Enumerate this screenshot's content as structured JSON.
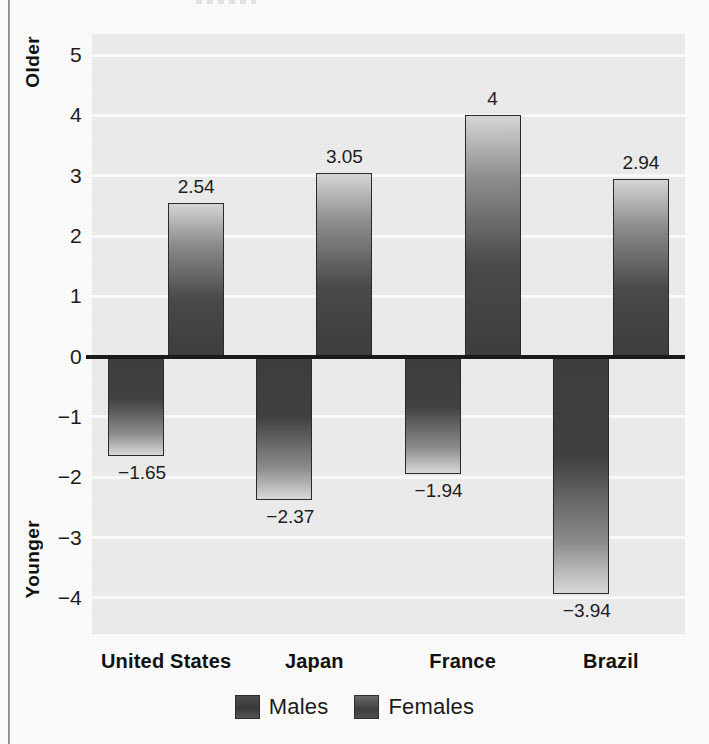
{
  "chart_data": {
    "type": "bar",
    "title": "",
    "xlabel": "",
    "ylabel": "",
    "categories": [
      "United States",
      "Japan",
      "France",
      "Brazil"
    ],
    "series": [
      {
        "name": "Males",
        "values": [
          -1.65,
          -2.37,
          -1.94,
          -3.94
        ],
        "value_labels": [
          "−1.65",
          "−2.37",
          "−1.94",
          "−3.94"
        ]
      },
      {
        "name": "Females",
        "values": [
          2.54,
          3.05,
          4,
          2.94
        ],
        "value_labels": [
          "2.54",
          "3.05",
          "4",
          "2.94"
        ]
      }
    ],
    "ylim": [
      -4.6,
      5.35
    ],
    "yticks": [
      5,
      4,
      3,
      2,
      1,
      0,
      -1,
      -2,
      -3,
      -4
    ],
    "ytick_labels": [
      "5",
      "4",
      "3",
      "2",
      "1",
      "0",
      "−1",
      "−2",
      "−3",
      "−4"
    ],
    "axis_top_label": "Older",
    "axis_bottom_label": "Younger",
    "grid": true,
    "grid_color": "#fafafa",
    "plot_background": "#ebebeb",
    "legend_position": "bottom-center",
    "zero_line_color": "#1a1a1a"
  },
  "legend": {
    "items": [
      {
        "label": "Males",
        "swatch": "male-swatch"
      },
      {
        "label": "Females",
        "swatch": "female-swatch"
      }
    ]
  }
}
